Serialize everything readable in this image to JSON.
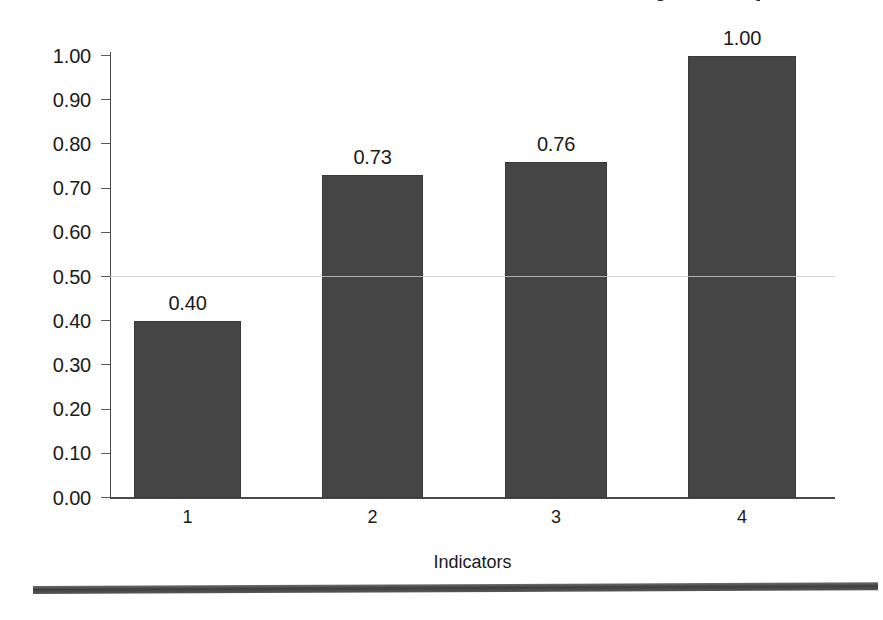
{
  "figure": {
    "clipped_title_fragment": "Figure heading",
    "page_rule": "horizontal-rule"
  },
  "chart_data": {
    "type": "bar",
    "title": "",
    "xlabel": "Indicators",
    "ylabel": "",
    "categories": [
      "1",
      "2",
      "3",
      "4"
    ],
    "values": [
      0.4,
      0.73,
      0.76,
      1.0
    ],
    "data_labels": [
      "0.40",
      "0.73",
      "0.76",
      "1.00"
    ],
    "ylim": [
      0.0,
      1.0
    ],
    "ytick_values": [
      0.0,
      0.1,
      0.2,
      0.3,
      0.4,
      0.5,
      0.6,
      0.7,
      0.8,
      0.9,
      1.0
    ],
    "ytick_labels": [
      "0.00",
      "0.10",
      "0.20",
      "0.30",
      "0.40",
      "0.50",
      "0.60",
      "0.70",
      "0.80",
      "0.90",
      "1.00"
    ],
    "xtick_labels": [
      "1",
      "2",
      "3",
      "4"
    ],
    "grid": false,
    "gridline_levels": [
      0.5
    ],
    "legend": null,
    "legend_position": "none",
    "bar_color": "#454545",
    "axis_color": "#4a4a4a",
    "text_color": "#1a1a1a",
    "series": [
      {
        "name": "Indicator value",
        "values": [
          0.4,
          0.73,
          0.76,
          1.0
        ]
      }
    ]
  }
}
